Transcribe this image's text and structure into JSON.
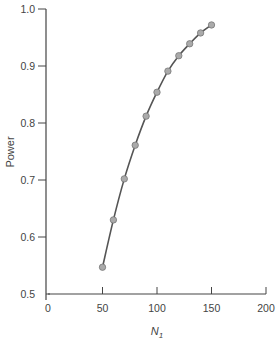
{
  "chart_data": {
    "type": "line",
    "title": "",
    "xlabel": "N",
    "xlabel_subscript": "1",
    "ylabel": "Power",
    "xlim": [
      0,
      200
    ],
    "ylim": [
      0.5,
      1.0
    ],
    "xticks": [
      0,
      50,
      100,
      150,
      200
    ],
    "xtick_labels": [
      "0",
      "50",
      "100",
      "150",
      "200"
    ],
    "yticks": [
      0.5,
      0.6,
      0.7,
      0.8,
      0.9,
      1.0
    ],
    "ytick_labels": [
      "0.5",
      "0.6",
      "0.7",
      "0.8",
      "0.9",
      "1.0"
    ],
    "grid": false,
    "legend": null,
    "series": [
      {
        "name": "Power",
        "x": [
          50,
          60,
          70,
          80,
          90,
          100,
          110,
          120,
          130,
          140,
          150
        ],
        "values": [
          0.547,
          0.63,
          0.702,
          0.761,
          0.812,
          0.854,
          0.891,
          0.918,
          0.939,
          0.958,
          0.972
        ],
        "line_color": "#555555",
        "marker_fill": "#aaaaaa",
        "marker_stroke": "#777777"
      }
    ]
  }
}
